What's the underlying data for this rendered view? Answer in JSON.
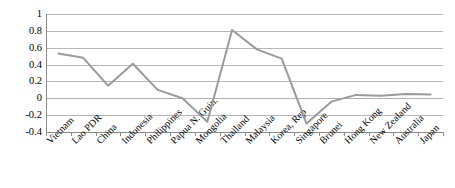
{
  "chart_data": {
    "type": "line",
    "title": "",
    "subtitle": "",
    "xlabel": "",
    "ylabel": "",
    "ylim": [
      -0.4,
      1
    ],
    "ytick_labels": [
      "1",
      "0.8",
      "0.6",
      "0.4",
      "0.2",
      "0",
      "-0.2",
      "-0.4"
    ],
    "ytick_values": [
      1,
      0.8,
      0.6,
      0.4,
      0.2,
      0,
      -0.2,
      -0.4
    ],
    "grid": true,
    "legend": false,
    "legend_position": "none",
    "categories": [
      "Vietnam",
      "Lao PDR",
      "China",
      "Indonesia",
      "Philippines",
      "Papua N. Guin.",
      "Mongolia",
      "Thailand",
      "Malaysia",
      "Korea, Rep",
      "Singapore",
      "Brunei",
      "Hong Kong",
      "New Zealand",
      "Australia",
      "Japan"
    ],
    "values": [
      0.53,
      0.48,
      0.15,
      0.41,
      0.1,
      0.0,
      -0.28,
      0.81,
      0.58,
      0.47,
      -0.3,
      -0.04,
      0.04,
      0.03,
      0.05,
      0.045
    ],
    "series_color": "#9a9a9a",
    "axis_color": "#8c8c8c",
    "grid_color": "#b8b8b8"
  }
}
